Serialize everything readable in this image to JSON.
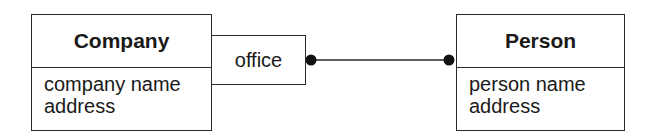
{
  "diagram": {
    "type": "UML class diagram with qualified association",
    "classes": [
      {
        "id": "company",
        "name": "Company",
        "attributes": [
          "company name",
          "address"
        ]
      },
      {
        "id": "person",
        "name": "Person",
        "attributes": [
          "person name",
          "address"
        ]
      }
    ],
    "qualifier": {
      "attached_to": "company",
      "label": "office"
    },
    "association": {
      "from": "company",
      "to": "person",
      "end_markers": [
        "filled-dot (many)",
        "filled-dot (many)"
      ]
    },
    "colors": {
      "line": "#2a2a2a",
      "background": "#ffffff",
      "text": "#1a1a1a"
    }
  }
}
